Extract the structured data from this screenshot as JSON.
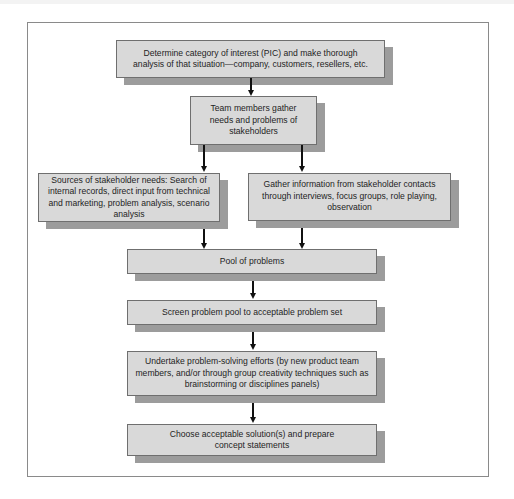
{
  "diagram": {
    "type": "flowchart",
    "steps": [
      {
        "id": "pic",
        "text": "Determine category of interest (PIC) and make thorough analysis of that situation—company, customers, resellers, etc."
      },
      {
        "id": "team",
        "text": "Team members gather needs and problems of stakeholders"
      },
      {
        "id": "sources",
        "text": "Sources of stakeholder needs: Search of internal records, direct input from technical and marketing, problem analysis, scenario analysis"
      },
      {
        "id": "gather",
        "text": "Gather information from stakeholder contacts through interviews, focus groups, role playing, observation"
      },
      {
        "id": "pool",
        "text": "Pool of problems"
      },
      {
        "id": "screen",
        "text": "Screen problem pool to acceptable problem set"
      },
      {
        "id": "undertake",
        "text": "Undertake problem-solving efforts (by new product team members, and/or through group creativity techniques such as brainstorming or disciplines panels)"
      },
      {
        "id": "choose",
        "text": "Choose acceptable solution(s) and prepare concept statements"
      }
    ],
    "edges": [
      [
        "pic",
        "team"
      ],
      [
        "team",
        "sources"
      ],
      [
        "team",
        "gather"
      ],
      [
        "sources",
        "pool"
      ],
      [
        "gather",
        "pool"
      ],
      [
        "pool",
        "screen"
      ],
      [
        "screen",
        "undertake"
      ],
      [
        "undertake",
        "choose"
      ]
    ],
    "colors": {
      "box_fill": "#d9d9d9",
      "box_border": "#6f6f6f",
      "shadow": "#9c9c9c",
      "arrow": "#111111",
      "frame": "#8a8a8a"
    }
  }
}
